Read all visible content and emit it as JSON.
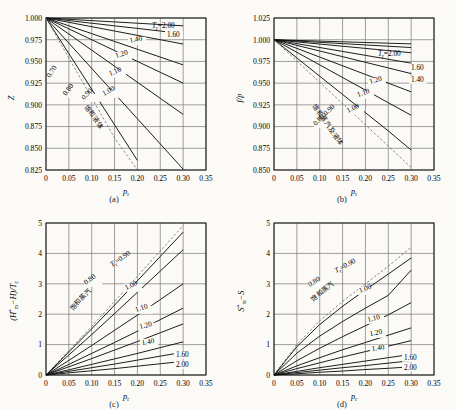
{
  "figure": {
    "background_color": "#fbfaf7",
    "line_color": "#111111",
    "grid_color": "#6b6b6b",
    "dashed_color": "#555555"
  },
  "panels": [
    {
      "id": "a",
      "caption": "(a)",
      "ylabel": "Z",
      "xlabel": "p",
      "xlabel_sub": "r",
      "saturation_note": "饱和液体",
      "tr_prefix": "T",
      "tr_prefix_sub": "r",
      "tr_prefix_eq": "=2.00"
    },
    {
      "id": "b",
      "caption": "(b)",
      "ylabel": "f/p",
      "xlabel": "p",
      "xlabel_sub": "r",
      "saturation_note": "饱和蒸汽及液体",
      "tr_prefix": "T",
      "tr_prefix_sub": "r",
      "tr_prefix_eq": "=2.00"
    },
    {
      "id": "c",
      "caption": "(c)",
      "ylabel": "(H*m−H)/Tc",
      "xlabel": "p",
      "xlabel_sub": "r",
      "saturation_note": "饱和蒸汽",
      "tr_label": "T",
      "tr_label_sub": "r",
      "tr_label_eq": "=0.90"
    },
    {
      "id": "d",
      "caption": "(d)",
      "ylabel": "S*m−S",
      "xlabel": "p",
      "xlabel_sub": "r",
      "saturation_note": "饱和蒸汽",
      "tr_label": "T",
      "tr_label_sub": "r",
      "tr_label_eq": "=0.90"
    }
  ],
  "chart_data": [
    {
      "type": "line",
      "panel": "a",
      "title": "(a)",
      "xlabel": "p_r",
      "ylabel": "Z",
      "xlim": [
        0,
        0.35
      ],
      "ylim": [
        0.825,
        1.0
      ],
      "xticks": [
        "0",
        "0.05",
        "0.10",
        "0.15",
        "0.20",
        "0.25",
        "0.30",
        "0.35"
      ],
      "xtick_values": [
        0,
        0.05,
        0.1,
        0.15,
        0.2,
        0.25,
        0.3,
        0.35
      ],
      "yticks": [
        "0.825",
        "0.850",
        "0.875",
        "0.900",
        "0.925",
        "0.950",
        "0.975",
        "1.000"
      ],
      "ytick_values": [
        0.825,
        0.85,
        0.875,
        0.9,
        0.925,
        0.95,
        0.975,
        1.0
      ],
      "grid": true,
      "legend": "inline curve labels",
      "x": [
        0,
        0.05,
        0.1,
        0.15,
        0.2,
        0.25,
        0.3
      ],
      "series": [
        {
          "name": "2.00",
          "label": "T_r=2.00",
          "values": [
            1.0,
            0.9985,
            0.997,
            0.9955,
            0.994,
            0.9925,
            0.991
          ]
        },
        {
          "name": "1.60",
          "label": "1.60",
          "values": [
            1.0,
            0.997,
            0.994,
            0.991,
            0.988,
            0.985,
            0.982
          ]
        },
        {
          "name": "1.40",
          "label": "1.40",
          "values": [
            1.0,
            0.995,
            0.99,
            0.985,
            0.98,
            0.975,
            0.97
          ]
        },
        {
          "name": "1.20",
          "label": "1.20",
          "values": [
            1.0,
            0.991,
            0.982,
            0.973,
            0.964,
            0.955,
            0.946
          ]
        },
        {
          "name": "1.10",
          "label": "1.10",
          "values": [
            1.0,
            0.9875,
            0.975,
            0.9625,
            0.95,
            0.9375,
            0.925
          ]
        },
        {
          "name": "1.00",
          "label": "1.00",
          "values": [
            1.0,
            0.9815,
            0.963,
            0.9445,
            0.926,
            0.9075,
            0.889
          ]
        },
        {
          "name": "0.90",
          "label": "0.90",
          "values": [
            1.0,
            0.971,
            0.942,
            0.913,
            0.884,
            0.855,
            0.826
          ]
        },
        {
          "name": "0.80",
          "label": "0.80",
          "values": [
            1.0,
            0.959,
            0.918,
            0.877,
            0.836,
            null,
            null
          ]
        },
        {
          "name": "0.70-sat",
          "label": "0.70",
          "values": [
            1.0,
            0.954,
            0.908,
            0.862,
            0.825,
            null,
            null
          ],
          "style": "dashed"
        }
      ],
      "annotations": [
        {
          "text": "饱和液体",
          "meaning": "saturated liquid",
          "rotated": true
        }
      ]
    },
    {
      "type": "line",
      "panel": "b",
      "title": "(b)",
      "xlabel": "p_r",
      "ylabel": "f/p",
      "xlim": [
        0,
        0.35
      ],
      "ylim": [
        0.85,
        1.025
      ],
      "xticks": [
        "0",
        "0.05",
        "0.10",
        "0.15",
        "0.20",
        "0.25",
        "0.30",
        "0.35"
      ],
      "xtick_values": [
        0,
        0.05,
        0.1,
        0.15,
        0.2,
        0.25,
        0.3,
        0.35
      ],
      "yticks": [
        "0.850",
        "0.875",
        "0.900",
        "0.925",
        "0.950",
        "0.975",
        "1.000",
        "1.025"
      ],
      "ytick_values": [
        0.85,
        0.875,
        0.9,
        0.925,
        0.95,
        0.975,
        1.0,
        1.025
      ],
      "grid": true,
      "legend": "inline curve labels",
      "x": [
        0,
        0.05,
        0.1,
        0.15,
        0.2,
        0.25,
        0.3
      ],
      "series": [
        {
          "name": "2.00",
          "label": "T_r=2.00",
          "values": [
            1.0,
            0.9992,
            0.9984,
            0.9976,
            0.9968,
            0.996,
            0.9952
          ]
        },
        {
          "name": "1.60",
          "label": "1.60",
          "values": [
            1.0,
            0.9985,
            0.997,
            0.9955,
            0.994,
            0.9925,
            0.991
          ]
        },
        {
          "name": "1.40",
          "label": "1.40",
          "values": [
            1.0,
            0.9975,
            0.995,
            0.9925,
            0.99,
            0.9875,
            0.985
          ]
        },
        {
          "name": "1.20",
          "label": "1.20",
          "values": [
            1.0,
            0.9955,
            0.991,
            0.9865,
            0.982,
            0.9775,
            0.973
          ]
        },
        {
          "name": "1.10",
          "label": "1.10",
          "values": [
            1.0,
            0.9935,
            0.987,
            0.9805,
            0.974,
            0.9675,
            0.961
          ]
        },
        {
          "name": "1.00",
          "label": "1.00",
          "values": [
            1.0,
            0.99,
            0.98,
            0.97,
            0.96,
            0.95,
            0.94
          ]
        },
        {
          "name": "0.90",
          "label": "0.90",
          "values": [
            1.0,
            0.9855,
            0.971,
            0.9565,
            0.942,
            0.9275,
            0.913
          ]
        },
        {
          "name": "0.80",
          "label": "0.80",
          "values": [
            1.0,
            0.979,
            0.958,
            0.937,
            0.916,
            0.895,
            0.873
          ]
        },
        {
          "name": "sat",
          "label": "saturation",
          "values": [
            1.0,
            0.9755,
            0.951,
            0.9265,
            0.902,
            0.8775,
            0.853
          ],
          "style": "dashed"
        }
      ],
      "annotations": [
        {
          "text": "饱和蒸汽及液体",
          "meaning": "saturated vapor and liquid",
          "rotated": true
        }
      ]
    },
    {
      "type": "line",
      "panel": "c",
      "title": "(c)",
      "xlabel": "p_r",
      "ylabel": "(H*m−H)/Tc",
      "xlim": [
        0,
        0.35
      ],
      "ylim": [
        0,
        5
      ],
      "xticks": [
        "0",
        "0.05",
        "0.10",
        "0.15",
        "0.20",
        "0.25",
        "0.30",
        "0.35"
      ],
      "xtick_values": [
        0,
        0.05,
        0.1,
        0.15,
        0.2,
        0.25,
        0.3,
        0.35
      ],
      "yticks": [
        "0",
        "1",
        "2",
        "3",
        "4",
        "5"
      ],
      "ytick_values": [
        0,
        1,
        2,
        3,
        4,
        5
      ],
      "grid": true,
      "legend": "inline curve labels",
      "x": [
        0,
        0.05,
        0.1,
        0.15,
        0.2,
        0.25,
        0.3
      ],
      "series": [
        {
          "name": "sat",
          "label": "饱和蒸汽",
          "values": [
            0,
            0.8,
            1.6,
            2.42,
            3.25,
            4.08,
            4.92
          ],
          "style": "dashed"
        },
        {
          "name": "0.80",
          "label": "0.80",
          "values": [
            0,
            0.76,
            1.52,
            2.3,
            3.1,
            3.9,
            4.7
          ]
        },
        {
          "name": "0.90",
          "label": "T_r=0.90",
          "values": [
            0,
            0.66,
            1.33,
            2.02,
            2.72,
            3.42,
            4.12
          ]
        },
        {
          "name": "1.00",
          "label": "1.00",
          "values": [
            0,
            0.48,
            0.97,
            1.47,
            1.97,
            2.48,
            3.0
          ]
        },
        {
          "name": "1.10",
          "label": "1.10",
          "values": [
            0,
            0.35,
            0.71,
            1.07,
            1.44,
            1.82,
            2.2
          ]
        },
        {
          "name": "1.20",
          "label": "1.20",
          "values": [
            0,
            0.27,
            0.54,
            0.82,
            1.1,
            1.39,
            1.68
          ]
        },
        {
          "name": "1.40",
          "label": "1.40",
          "values": [
            0,
            0.17,
            0.35,
            0.53,
            0.71,
            0.9,
            1.09
          ]
        },
        {
          "name": "1.60",
          "label": "1.60",
          "values": [
            0,
            0.12,
            0.24,
            0.36,
            0.49,
            0.62,
            0.75
          ]
        },
        {
          "name": "2.00",
          "label": "2.00",
          "values": [
            0,
            0.07,
            0.14,
            0.21,
            0.29,
            0.37,
            0.45
          ]
        }
      ],
      "annotations": [
        {
          "text": "饱和蒸汽",
          "meaning": "saturated vapor",
          "rotated": true
        }
      ]
    },
    {
      "type": "line",
      "panel": "d",
      "title": "(d)",
      "xlabel": "p_r",
      "ylabel": "S*m−S",
      "xlim": [
        0,
        0.35
      ],
      "ylim": [
        0,
        5
      ],
      "xticks": [
        "0",
        "0.05",
        "0.10",
        "0.15",
        "0.20",
        "0.25",
        "0.30",
        "0.35"
      ],
      "xtick_values": [
        0,
        0.05,
        0.1,
        0.15,
        0.2,
        0.25,
        0.3,
        0.35
      ],
      "yticks": [
        "0",
        "1",
        "2",
        "3",
        "4",
        "5"
      ],
      "ytick_values": [
        0,
        1,
        2,
        3,
        4,
        5
      ],
      "grid": true,
      "legend": "inline curve labels",
      "x": [
        0,
        0.05,
        0.1,
        0.15,
        0.2,
        0.25,
        0.3
      ],
      "series": [
        {
          "name": "sat",
          "label": "饱和蒸汽",
          "values": [
            0,
            1.0,
            1.78,
            2.42,
            3.0,
            3.58,
            4.2
          ],
          "style": "dashed"
        },
        {
          "name": "0.80",
          "label": "0.80",
          "values": [
            0,
            0.93,
            1.66,
            2.26,
            2.8,
            3.32,
            3.85
          ]
        },
        {
          "name": "0.90",
          "label": "T_r=0.90",
          "values": [
            0,
            0.72,
            1.28,
            1.76,
            2.2,
            2.62,
            3.45
          ]
        },
        {
          "name": "1.00",
          "label": "1.00",
          "values": [
            0,
            0.47,
            0.88,
            1.26,
            1.62,
            1.98,
            2.38
          ]
        },
        {
          "name": "1.10",
          "label": "1.10",
          "values": [
            0,
            0.3,
            0.57,
            0.83,
            1.07,
            1.31,
            1.55
          ]
        },
        {
          "name": "1.20",
          "label": "1.20",
          "values": [
            0,
            0.21,
            0.4,
            0.59,
            0.77,
            0.95,
            1.13
          ]
        },
        {
          "name": "1.40",
          "label": "1.40",
          "values": [
            0,
            0.12,
            0.24,
            0.35,
            0.46,
            0.57,
            0.68
          ]
        },
        {
          "name": "1.60",
          "label": "1.60",
          "values": [
            0,
            0.08,
            0.16,
            0.24,
            0.31,
            0.39,
            0.47
          ]
        },
        {
          "name": "2.00",
          "label": "2.00",
          "values": [
            0,
            0.04,
            0.09,
            0.13,
            0.18,
            0.22,
            0.27
          ]
        }
      ],
      "annotations": [
        {
          "text": "饱和蒸汽",
          "meaning": "saturated vapor",
          "rotated": true
        }
      ]
    }
  ]
}
